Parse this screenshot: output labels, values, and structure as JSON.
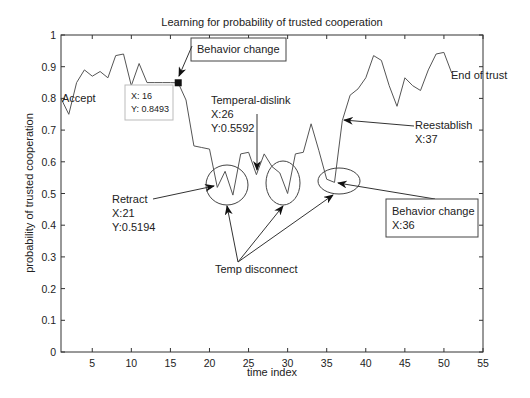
{
  "chart_data": {
    "type": "line",
    "title": "Learning for probability of trusted cooperation",
    "xlabel": "time index",
    "ylabel": "probability of trusted cooperation",
    "xlim": [
      1,
      55
    ],
    "ylim": [
      0,
      1
    ],
    "xticks": [
      5,
      10,
      15,
      20,
      25,
      30,
      35,
      40,
      45,
      50,
      55
    ],
    "yticks": [
      0,
      0.1,
      0.2,
      0.3,
      0.4,
      0.5,
      0.6,
      0.7,
      0.8,
      0.9,
      1
    ],
    "ytick_labels": [
      "0",
      "0.1",
      "0.2",
      "0.3",
      "0.4",
      "0.5",
      "0.6",
      "0.7",
      "0.8",
      "0.9",
      "1"
    ],
    "grid": false,
    "legend": null,
    "series": [
      {
        "name": "probability of trusted cooperation",
        "x": [
          1,
          2,
          3,
          4,
          5,
          6,
          7,
          8,
          9,
          10,
          11,
          12,
          13,
          14,
          15,
          16,
          17,
          18,
          19,
          20,
          21,
          22,
          23,
          24,
          25,
          26,
          27,
          28,
          29,
          30,
          31,
          32,
          33,
          34,
          35,
          36,
          37,
          38,
          39,
          40,
          41,
          42,
          43,
          44,
          45,
          46,
          47,
          48,
          49,
          50,
          51
        ],
        "values": [
          0.8,
          0.75,
          0.85,
          0.89,
          0.87,
          0.885,
          0.865,
          0.935,
          0.94,
          0.84,
          0.91,
          0.85,
          0.85,
          0.85,
          0.85,
          0.8493,
          0.795,
          0.65,
          0.645,
          0.64,
          0.5194,
          0.57,
          0.495,
          0.625,
          0.63,
          0.5592,
          0.625,
          0.585,
          0.565,
          0.5,
          0.625,
          0.63,
          0.72,
          0.635,
          0.545,
          0.535,
          0.73,
          0.81,
          0.83,
          0.865,
          0.935,
          0.92,
          0.84,
          0.775,
          0.865,
          0.84,
          0.825,
          0.89,
          0.94,
          0.945,
          0.88
        ],
        "color": "#555555"
      }
    ],
    "marker": {
      "x": 16,
      "y": 0.8493,
      "shape": "square",
      "color": "#111111"
    },
    "datatip": {
      "line1": "X: 16",
      "line2": "Y: 0.8493"
    },
    "annotations": {
      "accept": {
        "text": "Accept"
      },
      "behavior_change_top": {
        "text": "Behavior change"
      },
      "temperal_dislink": {
        "line1": "Temperal-dislink",
        "line2": "X:26",
        "line3": "Y:0.5592"
      },
      "retract": {
        "line1": "Retract",
        "line2": "X:21",
        "line3": "Y:0.5194"
      },
      "temp_disconnect": {
        "text": "Temp disconnect"
      },
      "reestablish": {
        "line1": "Reestablish",
        "line2": "X:37"
      },
      "behavior_change_bottom": {
        "line1": "Behavior change",
        "line2": "X:36"
      },
      "end_of_trust": {
        "text": "End of trust"
      }
    },
    "circled_regions": [
      {
        "label": "Temp disconnect 1",
        "center_x": 22.5,
        "center_y": 0.52
      },
      {
        "label": "Temp disconnect 2",
        "center_x": 30,
        "center_y": 0.53
      },
      {
        "label": "Temp disconnect 3 / Behavior change",
        "center_x": 36,
        "center_y": 0.54
      }
    ]
  }
}
